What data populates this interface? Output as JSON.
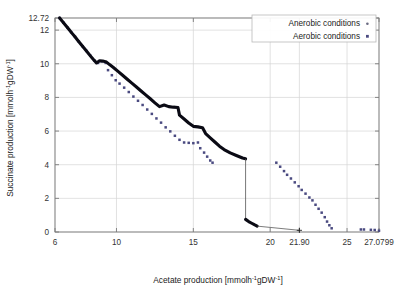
{
  "figure": {
    "background": "#ffffff",
    "frame_color": "#7a7a7a",
    "grid_color": "#d5d5d5"
  },
  "axes": {
    "x": {
      "label_prefix": "Acetate  production [mmolh",
      "label_sup1": "-1",
      "label_mid": "gDW",
      "label_sup2": "-1",
      "label_suffix": "]",
      "full_label": "Acetate  production [mmolh-1gDW-1]",
      "ticks": [
        "6",
        "10",
        "15",
        "20",
        "21.90",
        "25",
        "27.0799"
      ],
      "tick_values": [
        6,
        10,
        15,
        20,
        21.9,
        25,
        27.0799
      ],
      "min": 6,
      "max": 27.0799
    },
    "y": {
      "label_prefix": "Succinate  production [mmolh",
      "label_sup1": "-1",
      "label_mid": "gDW",
      "label_sup2": "-1",
      "label_suffix": "]",
      "full_label": "Succinate  production [mmolh-1gDW-1]",
      "ticks": [
        "0",
        "2",
        "4",
        "6",
        "8",
        "10",
        "12",
        "12.72"
      ],
      "tick_values": [
        0,
        2,
        4,
        6,
        8,
        10,
        12,
        12.72
      ],
      "min": 0,
      "max": 12.72
    }
  },
  "legend": {
    "position": "top-right",
    "border_color": "#b9b9b9",
    "entries": [
      {
        "label": "Anerobic conditions",
        "marker": "dot-small",
        "color": "#6b6b82"
      },
      {
        "label": "Aerobic conditions",
        "marker": "square-small",
        "color": "#4a4a80"
      }
    ]
  },
  "chart_data": {
    "type": "scatter",
    "title": "",
    "xlabel": "Acetate  production [mmolh-1gDW-1]",
    "ylabel": "Succinate  production [mmolh-1gDW-1]",
    "xlim": [
      6,
      27.0799
    ],
    "ylim": [
      0,
      12.72
    ],
    "xticks": [
      6,
      10,
      15,
      20,
      21.9,
      25,
      27.0799
    ],
    "yticks": [
      0,
      2,
      4,
      6,
      8,
      10,
      12,
      12.72
    ],
    "grid": true,
    "legend_position": "top-right",
    "series": [
      {
        "name": "Anerobic conditions",
        "color": "#0a0a14",
        "style": "thick-line-with-breaks",
        "marker": "dot-small",
        "points": [
          [
            6.3,
            12.72
          ],
          [
            6.5,
            12.5
          ],
          [
            6.7,
            12.28
          ],
          [
            6.9,
            12.05
          ],
          [
            7.1,
            11.82
          ],
          [
            7.3,
            11.6
          ],
          [
            7.5,
            11.37
          ],
          [
            7.7,
            11.14
          ],
          [
            7.9,
            10.92
          ],
          [
            8.1,
            10.7
          ],
          [
            8.3,
            10.47
          ],
          [
            8.5,
            10.25
          ],
          [
            8.7,
            10.05
          ],
          [
            8.9,
            10.18
          ],
          [
            9.1,
            10.16
          ],
          [
            9.35,
            10.1
          ],
          [
            9.55,
            9.95
          ],
          [
            9.8,
            9.78
          ],
          [
            10.1,
            9.55
          ],
          [
            10.4,
            9.32
          ],
          [
            10.7,
            9.08
          ],
          [
            11.0,
            8.85
          ],
          [
            11.3,
            8.62
          ],
          [
            11.6,
            8.38
          ],
          [
            11.9,
            8.15
          ],
          [
            12.2,
            7.92
          ],
          [
            12.5,
            7.68
          ],
          [
            12.8,
            7.45
          ],
          [
            13.1,
            7.55
          ],
          [
            13.4,
            7.45
          ],
          [
            13.7,
            7.42
          ],
          [
            14.0,
            7.4
          ],
          [
            14.1,
            6.95
          ],
          [
            14.4,
            6.72
          ],
          [
            14.7,
            6.48
          ],
          [
            15.0,
            6.28
          ],
          [
            15.3,
            6.25
          ],
          [
            15.6,
            6.2
          ],
          [
            15.8,
            5.85
          ],
          [
            16.1,
            5.6
          ],
          [
            16.4,
            5.35
          ],
          [
            16.7,
            5.1
          ],
          [
            17.0,
            4.9
          ],
          [
            17.4,
            4.7
          ],
          [
            17.8,
            4.55
          ],
          [
            18.2,
            4.4
          ],
          [
            18.4,
            4.35
          ]
        ],
        "drop_segment": {
          "x": 18.4,
          "y_from": 4.35,
          "y_to": 0.75
        },
        "tail_points": [
          [
            18.4,
            0.75
          ],
          [
            18.6,
            0.62
          ],
          [
            18.8,
            0.52
          ],
          [
            19.0,
            0.42
          ],
          [
            19.15,
            0.35
          ]
        ],
        "thin_connector": {
          "from": [
            19.15,
            0.35
          ],
          "to": [
            21.9,
            0.1
          ]
        },
        "end_marker": [
          21.9,
          0.1
        ]
      },
      {
        "name": "Aerobic conditions",
        "color": "#4a4a80",
        "style": "dotted",
        "marker": "square-small",
        "branch1": [
          [
            6.3,
            12.72
          ],
          [
            6.55,
            12.44
          ],
          [
            6.8,
            12.16
          ],
          [
            7.05,
            11.88
          ],
          [
            7.3,
            11.6
          ],
          [
            7.55,
            11.32
          ],
          [
            7.8,
            11.04
          ],
          [
            8.05,
            10.76
          ],
          [
            8.3,
            10.48
          ],
          [
            8.55,
            10.2
          ],
          [
            8.8,
            10.05
          ],
          [
            9.05,
            10.14
          ],
          [
            9.3,
            10.05
          ],
          [
            9.45,
            9.62
          ],
          [
            9.7,
            9.32
          ],
          [
            9.95,
            9.02
          ],
          [
            10.2,
            8.82
          ],
          [
            10.5,
            8.58
          ],
          [
            10.8,
            8.32
          ],
          [
            11.1,
            8.05
          ],
          [
            11.4,
            7.8
          ],
          [
            11.7,
            7.55
          ],
          [
            12.0,
            7.28
          ],
          [
            12.3,
            7.02
          ],
          [
            12.6,
            6.75
          ],
          [
            12.9,
            6.5
          ],
          [
            13.2,
            6.22
          ],
          [
            13.5,
            5.98
          ],
          [
            13.8,
            5.72
          ],
          [
            14.1,
            5.48
          ],
          [
            14.4,
            5.32
          ],
          [
            14.7,
            5.3
          ],
          [
            15.0,
            5.28
          ],
          [
            15.3,
            5.32
          ],
          [
            15.45,
            4.98
          ],
          [
            15.7,
            4.72
          ],
          [
            15.9,
            4.48
          ],
          [
            16.1,
            4.25
          ],
          [
            16.25,
            4.12
          ]
        ],
        "branch2": [
          [
            20.4,
            4.12
          ],
          [
            20.65,
            3.88
          ],
          [
            20.9,
            3.62
          ],
          [
            21.1,
            3.4
          ],
          [
            21.35,
            3.18
          ],
          [
            21.6,
            2.95
          ],
          [
            21.85,
            2.72
          ],
          [
            22.05,
            2.5
          ],
          [
            22.3,
            2.28
          ],
          [
            22.55,
            2.05
          ],
          [
            22.75,
            1.88
          ],
          [
            22.95,
            1.62
          ],
          [
            23.15,
            1.38
          ],
          [
            23.35,
            1.15
          ],
          [
            23.55,
            0.88
          ],
          [
            23.7,
            0.62
          ],
          [
            23.85,
            0.4
          ],
          [
            24.0,
            0.22
          ]
        ],
        "isolated_points": [
          [
            25.9,
            0.15
          ],
          [
            26.1,
            0.15
          ],
          [
            26.55,
            0.13
          ],
          [
            26.8,
            0.12
          ],
          [
            27.0799,
            0.08
          ]
        ]
      }
    ]
  }
}
